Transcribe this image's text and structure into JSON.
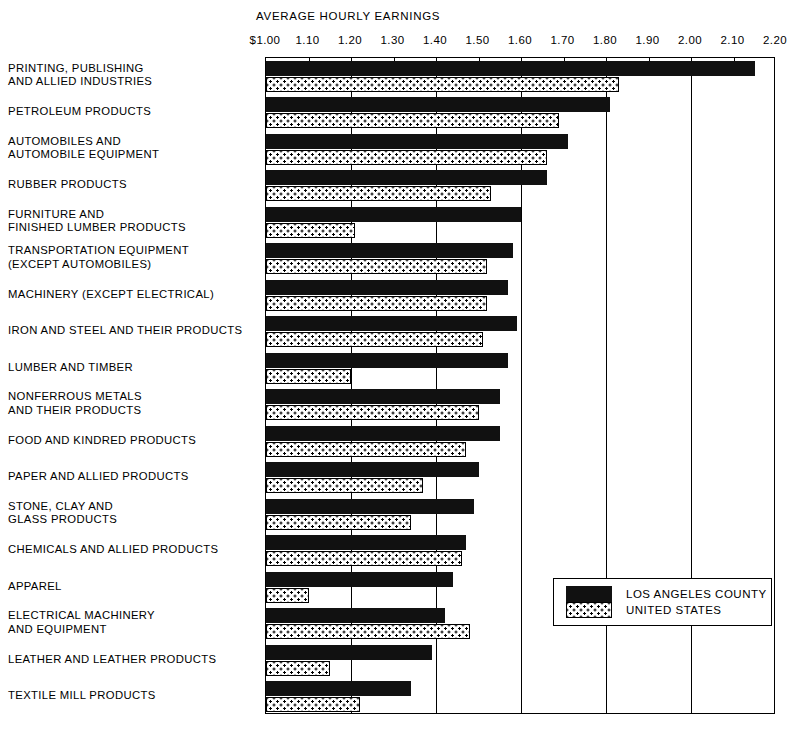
{
  "chart_data": {
    "type": "bar",
    "orientation": "horizontal",
    "title": "AVERAGE HOURLY EARNINGS",
    "xlabel": "",
    "ylabel": "",
    "xlim": [
      1.0,
      2.2
    ],
    "grid": true,
    "tick_step": 0.1,
    "gridline_step": 0.2,
    "tick_labels": [
      "$1.00",
      "1.10",
      "1.20",
      "1.30",
      "1.40",
      "1.50",
      "1.60",
      "1.70",
      "1.80",
      "1.90",
      "2.00",
      "2.10",
      "2.20"
    ],
    "tick_values": [
      1.0,
      1.1,
      1.2,
      1.3,
      1.4,
      1.5,
      1.6,
      1.7,
      1.8,
      1.9,
      2.0,
      2.1,
      2.2
    ],
    "legend_position": "bottom-right",
    "categories": [
      "PRINTING, PUBLISHING\nAND ALLIED INDUSTRIES",
      "PETROLEUM PRODUCTS",
      "AUTOMOBILES AND\nAUTOMOBILE EQUIPMENT",
      "RUBBER PRODUCTS",
      "FURNITURE AND\nFINISHED LUMBER PRODUCTS",
      "TRANSPORTATION EQUIPMENT\n(EXCEPT AUTOMOBILES)",
      "MACHINERY (EXCEPT ELECTRICAL)",
      "IRON AND STEEL AND THEIR PRODUCTS",
      "LUMBER AND TIMBER",
      "NONFERROUS METALS\nAND THEIR PRODUCTS",
      "FOOD AND KINDRED PRODUCTS",
      "PAPER AND ALLIED PRODUCTS",
      "STONE, CLAY AND\nGLASS PRODUCTS",
      "CHEMICALS AND ALLIED PRODUCTS",
      "APPAREL",
      "ELECTRICAL MACHINERY\nAND EQUIPMENT",
      "LEATHER AND LEATHER PRODUCTS",
      "TEXTILE MILL PRODUCTS"
    ],
    "series": [
      {
        "name": "LOS ANGELES COUNTY",
        "color": "#111111",
        "pattern": "solid",
        "values": [
          2.15,
          1.81,
          1.71,
          1.66,
          1.6,
          1.58,
          1.57,
          1.59,
          1.57,
          1.55,
          1.55,
          1.5,
          1.49,
          1.47,
          1.44,
          1.42,
          1.39,
          1.34
        ]
      },
      {
        "name": "UNITED STATES",
        "color": "#ffffff",
        "pattern": "dotted",
        "values": [
          1.83,
          1.69,
          1.66,
          1.53,
          1.21,
          1.52,
          1.52,
          1.51,
          1.2,
          1.5,
          1.47,
          1.37,
          1.34,
          1.46,
          1.1,
          1.48,
          1.15,
          1.22
        ]
      }
    ]
  },
  "legend": {
    "la_label": "LOS ANGELES COUNTY",
    "us_label": "UNITED STATES"
  }
}
